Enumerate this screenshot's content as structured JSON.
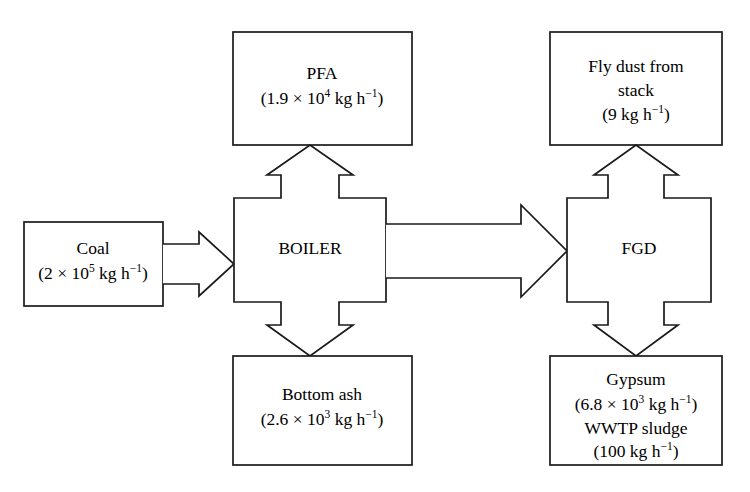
{
  "diagram": {
    "type": "process-flow-block-diagram",
    "title": "",
    "background_color": "#ffffff",
    "line_color": "#1a1a1a",
    "text_color": "#000000",
    "nodes": [
      {
        "id": "coal",
        "name": "coal-box",
        "role": "input",
        "lines": [
          {
            "text": "Coal"
          },
          {
            "pre": "(2 × 10",
            "sup": "5",
            "post": " kg h",
            "sup2": "−1",
            "post2": ")"
          }
        ],
        "label": "Coal",
        "value_text": "(2 × 10^5 kg h^-1)",
        "quantity": 200000,
        "unit": "kg h-1"
      },
      {
        "id": "boiler",
        "name": "boiler-box",
        "role": "process",
        "lines": [
          {
            "text": "BOILER"
          }
        ],
        "label": "BOILER",
        "value_text": "",
        "quantity": null,
        "unit": ""
      },
      {
        "id": "pfa",
        "name": "pfa-box",
        "role": "output",
        "lines": [
          {
            "text": "PFA"
          },
          {
            "pre": "(1.9 × 10",
            "sup": "4",
            "post": " kg h",
            "sup2": "−1",
            "post2": ")"
          }
        ],
        "label": "PFA",
        "value_text": "(1.9 × 10^4 kg h^-1)",
        "quantity": 19000,
        "unit": "kg h-1"
      },
      {
        "id": "bottom-ash",
        "name": "bottom-ash-box",
        "role": "output",
        "lines": [
          {
            "text": "Bottom ash"
          },
          {
            "pre": "(2.6 × 10",
            "sup": "3",
            "post": " kg h",
            "sup2": "−1",
            "post2": ")"
          }
        ],
        "label": "Bottom ash",
        "value_text": "(2.6 × 10^3 kg h^-1)",
        "quantity": 2600,
        "unit": "kg h-1"
      },
      {
        "id": "fgd",
        "name": "fgd-box",
        "role": "process",
        "lines": [
          {
            "text": "FGD"
          }
        ],
        "label": "FGD",
        "value_text": "",
        "quantity": null,
        "unit": ""
      },
      {
        "id": "fly-dust",
        "name": "fly-dust-box",
        "role": "output",
        "lines": [
          {
            "text": "Fly dust from"
          },
          {
            "text": "stack"
          },
          {
            "pre": "(9 kg h",
            "sup": "−1",
            "post": ")"
          }
        ],
        "label": "Fly dust from stack",
        "value_text": "(9 kg h^-1)",
        "quantity": 9,
        "unit": "kg h-1"
      },
      {
        "id": "gypsum",
        "name": "gypsum-box",
        "role": "output",
        "lines": [
          {
            "text": "Gypsum"
          },
          {
            "pre": "(6.8 × 10",
            "sup": "3",
            "post": " kg h",
            "sup2": "−1",
            "post2": ")"
          },
          {
            "text": "WWTP sludge"
          },
          {
            "pre": "(100 kg h",
            "sup": "−1",
            "post": ")"
          }
        ],
        "label": "Gypsum / WWTP sludge",
        "value_text": "(6.8 × 10^3 kg h^-1) ; (100 kg h^-1)",
        "quantity": 6800,
        "unit": "kg h-1"
      }
    ],
    "arrows": [
      {
        "id": "coal-to-boiler",
        "name": "arrow-coal-to-boiler",
        "from": "coal",
        "to": "boiler",
        "direction": "right"
      },
      {
        "id": "boiler-to-pfa",
        "name": "arrow-boiler-to-pfa",
        "from": "boiler",
        "to": "pfa",
        "direction": "up"
      },
      {
        "id": "boiler-to-bottom-ash",
        "name": "arrow-boiler-to-bottom-ash",
        "from": "boiler",
        "to": "bottom-ash",
        "direction": "down"
      },
      {
        "id": "boiler-to-fgd",
        "name": "arrow-boiler-to-fgd",
        "from": "boiler",
        "to": "fgd",
        "direction": "right"
      },
      {
        "id": "fgd-to-fly-dust",
        "name": "arrow-fgd-to-fly-dust",
        "from": "fgd",
        "to": "fly-dust",
        "direction": "up"
      },
      {
        "id": "fgd-to-gypsum",
        "name": "arrow-fgd-to-gypsum",
        "from": "fgd",
        "to": "gypsum",
        "direction": "down"
      }
    ]
  },
  "text": {
    "coal_l1": "Coal",
    "coal_l2_pre": "(2 × 10",
    "coal_l2_sup": "5",
    "coal_l2_mid": " kg h",
    "coal_l2_sup2": "−1",
    "coal_l2_end": ")",
    "boiler_l1": "BOILER",
    "pfa_l1": "PFA",
    "pfa_l2_pre": "(1.9 × 10",
    "pfa_l2_sup": "4",
    "pfa_l2_mid": " kg h",
    "pfa_l2_sup2": "−1",
    "pfa_l2_end": ")",
    "bottomash_l1": "Bottom ash",
    "bottomash_l2_pre": "(2.6 × 10",
    "bottomash_l2_sup": "3",
    "bottomash_l2_mid": " kg h",
    "bottomash_l2_sup2": "−1",
    "bottomash_l2_end": ")",
    "fgd_l1": "FGD",
    "flydust_l1": "Fly dust from",
    "flydust_l2": "stack",
    "flydust_l3_pre": "(9 kg h",
    "flydust_l3_sup": "−1",
    "flydust_l3_end": ")",
    "gypsum_l1": "Gypsum",
    "gypsum_l2_pre": "(6.8 × 10",
    "gypsum_l2_sup": "3",
    "gypsum_l2_mid": " kg h",
    "gypsum_l2_sup2": "−1",
    "gypsum_l2_end": ")",
    "gypsum_l3": "WWTP sludge",
    "gypsum_l4_pre": "(100 kg h",
    "gypsum_l4_sup": "−1",
    "gypsum_l4_end": ")"
  }
}
